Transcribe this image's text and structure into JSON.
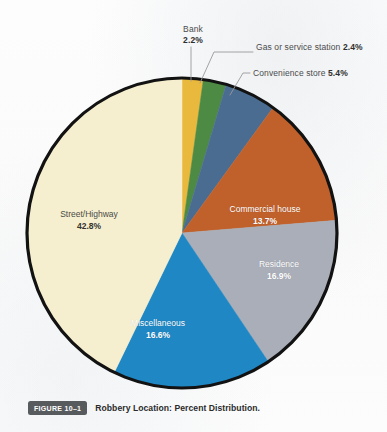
{
  "figure": {
    "badge": "FIGURE 10–1",
    "caption": "Robbery Location: Percent Distribution."
  },
  "chart_data": {
    "type": "pie",
    "title": "Robbery Location: Percent Distribution.",
    "xlabel": "",
    "ylabel": "",
    "units": "percent",
    "total": 100.0,
    "start_angle_deg": 0,
    "direction": "clockwise",
    "legend_position": "none",
    "grid": false,
    "categories": [
      "Bank",
      "Gas or service station",
      "Convenience store",
      "Commercial house",
      "Residence",
      "Miscellaneous",
      "Street/Highway"
    ],
    "values": [
      2.2,
      2.4,
      5.4,
      13.7,
      16.9,
      16.6,
      42.8
    ],
    "labels": [
      "2.2%",
      "2.4%",
      "5.4%",
      "13.7%",
      "16.9%",
      "16.6%",
      "42.8%"
    ],
    "colors": [
      "#e9b93e",
      "#4d8b45",
      "#4a6c91",
      "#c0602b",
      "#a9aeb8",
      "#1e87c4",
      "#f6efcf"
    ],
    "slices": [
      {
        "name": "Bank",
        "value": 2.2,
        "label": "2.2%",
        "color": "#e9b93e",
        "label_placement": "callout",
        "label_style": "dark"
      },
      {
        "name": "Gas or service station",
        "value": 2.4,
        "label": "2.4%",
        "color": "#4d8b45",
        "label_placement": "callout",
        "label_style": "dark"
      },
      {
        "name": "Convenience store",
        "value": 5.4,
        "label": "5.4%",
        "color": "#4a6c91",
        "label_placement": "callout",
        "label_style": "dark"
      },
      {
        "name": "Commercial house",
        "value": 13.7,
        "label": "13.7%",
        "color": "#c0602b",
        "label_placement": "inside",
        "label_style": "light"
      },
      {
        "name": "Residence",
        "value": 16.9,
        "label": "16.9%",
        "color": "#a9aeb8",
        "label_placement": "inside",
        "label_style": "light"
      },
      {
        "name": "Miscellaneous",
        "value": 16.6,
        "label": "16.6%",
        "color": "#1e87c4",
        "label_placement": "inside",
        "label_style": "light"
      },
      {
        "name": "Street/Highway",
        "value": 42.8,
        "label": "42.8%",
        "color": "#f6efcf",
        "label_placement": "inside",
        "label_style": "dark"
      }
    ]
  },
  "callouts": {
    "bank": {
      "name": "Bank",
      "pct": "2.2%"
    },
    "gas": {
      "name": "Gas or service station",
      "pct": "2.4%"
    },
    "convenience": {
      "name": "Convenience store",
      "pct": "5.4%"
    }
  },
  "inside_labels": {
    "commercial": {
      "name": "Commercial house",
      "pct": "13.7%"
    },
    "residence": {
      "name": "Residence",
      "pct": "16.9%"
    },
    "miscellaneous": {
      "name": "Miscellaneous",
      "pct": "16.6%"
    },
    "street": {
      "name": "Street/Highway",
      "pct": "42.8%"
    }
  },
  "style": {
    "outline_color": "#121212",
    "leader_color": "#9a9a9a",
    "background": "#fcfcfc",
    "badge_bg": "#585b5e"
  }
}
